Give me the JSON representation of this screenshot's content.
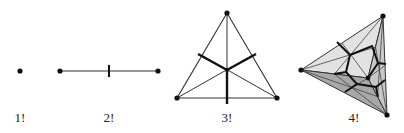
{
  "figure": {
    "panels": [
      {
        "id": "p1",
        "label": "1!",
        "shape": "point",
        "label_x": 20,
        "label_y": 110
      },
      {
        "id": "p2",
        "label": "2!",
        "shape": "segment",
        "label_x": 109,
        "label_y": 110
      },
      {
        "id": "p3",
        "label": "3!",
        "shape": "triangle",
        "label_x": 227,
        "label_y": 110
      },
      {
        "id": "p4",
        "label": "4!",
        "shape": "tetrahedron",
        "label_x": 354,
        "label_y": 110
      }
    ],
    "colors": {
      "line": "#333333",
      "thick": "#111111",
      "vertex": "#111111",
      "face_light": "#e4e4e4",
      "face_mid": "#c4c4c4",
      "face_dark": "#9a9a9a"
    }
  }
}
